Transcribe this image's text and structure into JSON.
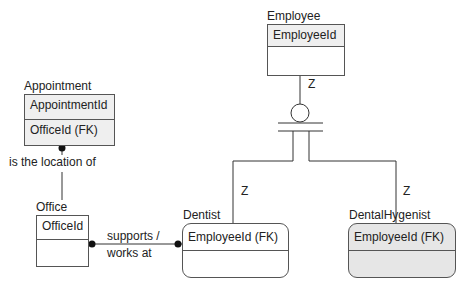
{
  "entities": {
    "employee": {
      "title": "Employee",
      "key": "EmployeeId"
    },
    "appointment": {
      "title": "Appointment",
      "key": "AppointmentId",
      "attr": "OfficeId (FK)"
    },
    "office": {
      "title": "Office",
      "key": "OfficeId"
    },
    "dentist": {
      "title": "Dentist",
      "key": "EmployeeId (FK)"
    },
    "hygenist": {
      "title": "DentalHygenist",
      "key": "EmployeeId (FK)"
    }
  },
  "relationships": {
    "office_appointment": "is the location of",
    "office_dentist_1": "supports /",
    "office_dentist_2": "works at"
  },
  "cardinality": {
    "employee_sub": "Z",
    "dentist": "Z",
    "hygenist": "Z"
  }
}
